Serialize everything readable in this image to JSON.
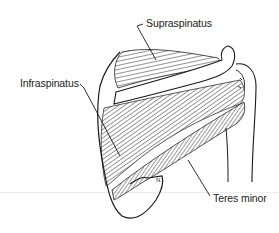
{
  "figure": {
    "labels": [
      {
        "id": "supraspinatus",
        "text": "Supraspinatus"
      },
      {
        "id": "infraspinatus",
        "text": "Infraspinatus"
      },
      {
        "id": "teres-minor",
        "text": "Teres minor"
      }
    ],
    "marker_text": "N.",
    "colors": {
      "ink": "#1a1a1a",
      "label_text": "#222222",
      "background": "#ffffff",
      "ground_line": "#ececec"
    }
  }
}
